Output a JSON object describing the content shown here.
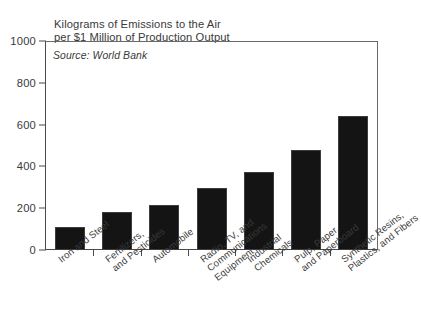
{
  "chart_data": {
    "type": "bar",
    "title": "Kilograms of Emissions to the Air\nper $1 Million of Production Output",
    "title_line1": "Kilograms of Emissions to the Air",
    "title_line2": "per $1 Million of Production Output",
    "subtitle": "Source: World Bank",
    "xlabel": "",
    "ylabel": "",
    "ylim": [
      0,
      1000
    ],
    "yticks": [
      0,
      200,
      400,
      600,
      800,
      1000
    ],
    "ytick_labels": [
      "0",
      "200",
      "400",
      "600",
      "800",
      "1000"
    ],
    "grid": false,
    "legend": false,
    "bar_color": "#141414",
    "categories": [
      "Iron and Steel",
      "Fertilizers and Pesticides",
      "Automobile",
      "Radio, TV, and Communications Equipment",
      "Industrial Chemicals",
      "Pulp, Paper, and Paperboard",
      "Synthetic Resins, Plastics, and Fibers"
    ],
    "category_lines": [
      [
        "Iron and Steel"
      ],
      [
        "Fertilizers,",
        "and Pesticides"
      ],
      [
        "Automobile"
      ],
      [
        "Radio, TV, and",
        "Communications",
        "Equipment"
      ],
      [
        "Industrial",
        "Chemicals"
      ],
      [
        "Pulp, Paper,",
        "and Paperboard"
      ],
      [
        "Synthetic Resins,",
        "Plastics, and Fibers"
      ]
    ],
    "values": [
      110,
      180,
      215,
      295,
      375,
      480,
      640
    ]
  }
}
